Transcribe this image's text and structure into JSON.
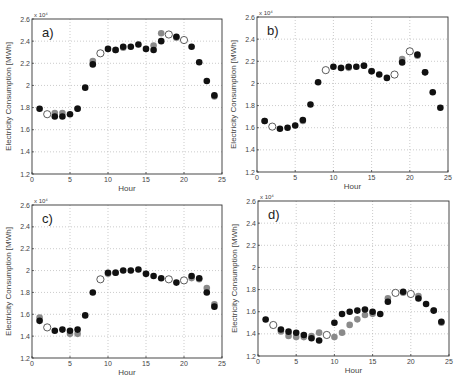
{
  "chart_data": [
    {
      "type": "scatter",
      "panel": "a)",
      "xlabel": "Hour",
      "ylabel": "Electricity Consumption [MWh]",
      "y_multiplier": "x 10^4",
      "xlim": [
        0,
        25
      ],
      "ylim": [
        1.2,
        2.6
      ],
      "xticks": [
        0,
        5,
        10,
        15,
        20,
        25
      ],
      "yticks": [
        1.2,
        1.4,
        1.6,
        1.8,
        2,
        2.2,
        2.4,
        2.6
      ],
      "grid": true,
      "series": [
        {
          "name": "gray",
          "style": "filled-gray",
          "x": [
            3,
            4,
            6,
            8,
            11,
            12,
            16,
            17,
            19,
            24
          ],
          "values": [
            1.74,
            1.74,
            1.78,
            2.21,
            2.31,
            2.33,
            2.35,
            2.46,
            2.42,
            1.89
          ]
        },
        {
          "name": "black",
          "style": "filled-black",
          "x": [
            1,
            3,
            4,
            5,
            6,
            7,
            8,
            10,
            11,
            12,
            13,
            14,
            15,
            16,
            17,
            19,
            21,
            22,
            23,
            24
          ],
          "values": [
            1.79,
            1.72,
            1.72,
            1.74,
            1.79,
            1.98,
            2.19,
            2.33,
            2.32,
            2.35,
            2.35,
            2.37,
            2.33,
            2.32,
            2.4,
            2.44,
            2.35,
            2.21,
            2.04,
            1.91
          ]
        },
        {
          "name": "open",
          "style": "open-circle",
          "x": [
            2,
            9,
            18,
            20
          ],
          "values": [
            1.74,
            2.29,
            2.46,
            2.41
          ]
        }
      ]
    },
    {
      "type": "scatter",
      "panel": "b)",
      "xlabel": "Hour",
      "ylabel": "Electricity Consumption [MWh]",
      "y_multiplier": "x 10^4",
      "xlim": [
        0,
        25
      ],
      "ylim": [
        1.2,
        2.6
      ],
      "xticks": [
        0,
        5,
        10,
        15,
        20,
        25
      ],
      "yticks": [
        1.2,
        1.4,
        1.6,
        1.8,
        2,
        2.2,
        2.4,
        2.6
      ],
      "grid": true,
      "series": [
        {
          "name": "gray",
          "style": "filled-gray",
          "x": [
            1,
            6,
            11,
            12,
            14,
            15,
            19,
            21,
            22
          ],
          "values": [
            1.65,
            1.65,
            2.13,
            2.13,
            2.15,
            2.1,
            2.21,
            2.24,
            2.09
          ]
        },
        {
          "name": "black",
          "style": "filled-black",
          "x": [
            1,
            3,
            4,
            5,
            6,
            7,
            8,
            10,
            11,
            12,
            13,
            14,
            15,
            16,
            17,
            19,
            21,
            22,
            23,
            24
          ],
          "values": [
            1.66,
            1.59,
            1.6,
            1.62,
            1.67,
            1.81,
            2.01,
            2.15,
            2.14,
            2.15,
            2.15,
            2.16,
            2.11,
            2.08,
            2.05,
            2.19,
            2.26,
            2.1,
            1.92,
            1.78
          ]
        },
        {
          "name": "open",
          "style": "open-circle",
          "x": [
            2,
            9,
            18,
            20
          ],
          "values": [
            1.61,
            2.12,
            2.08,
            2.29
          ]
        }
      ]
    },
    {
      "type": "scatter",
      "panel": "c)",
      "xlabel": "Hour",
      "ylabel": "Electricity Consumption [MWh]",
      "y_multiplier": "x 10^4",
      "xlim": [
        0,
        25
      ],
      "ylim": [
        1.2,
        2.6
      ],
      "xticks": [
        0,
        5,
        10,
        15,
        20,
        25
      ],
      "yticks": [
        1.2,
        1.4,
        1.6,
        1.8,
        2,
        2.2,
        2.4,
        2.6
      ],
      "grid": true,
      "series": [
        {
          "name": "gray",
          "style": "filled-gray",
          "x": [
            1,
            5,
            6,
            10,
            11,
            15,
            21,
            22,
            23,
            24
          ],
          "values": [
            1.56,
            1.41,
            1.41,
            1.96,
            1.97,
            1.96,
            1.92,
            1.91,
            1.83,
            1.68
          ]
        },
        {
          "name": "black",
          "style": "filled-black",
          "x": [
            1,
            3,
            4,
            5,
            6,
            7,
            8,
            10,
            11,
            12,
            13,
            14,
            15,
            16,
            17,
            19,
            21,
            22,
            23,
            24
          ],
          "values": [
            1.54,
            1.45,
            1.46,
            1.45,
            1.46,
            1.59,
            1.8,
            1.98,
            1.98,
            2.0,
            2.0,
            2.01,
            1.97,
            1.95,
            1.93,
            1.89,
            1.95,
            1.93,
            1.8,
            1.67
          ]
        },
        {
          "name": "open",
          "style": "open-circle",
          "x": [
            2,
            9,
            18,
            20
          ],
          "values": [
            1.48,
            1.92,
            1.92,
            1.91
          ]
        }
      ]
    },
    {
      "type": "scatter",
      "panel": "d)",
      "xlabel": "Hour",
      "ylabel": "Electricity Consumption [MWh]",
      "y_multiplier": "x 10^4",
      "xlim": [
        0,
        25
      ],
      "ylim": [
        1.2,
        2.6
      ],
      "xticks": [
        0,
        5,
        10,
        15,
        20,
        25
      ],
      "yticks": [
        1.2,
        1.4,
        1.6,
        1.8,
        2,
        2.2,
        2.4,
        2.6
      ],
      "grid": true,
      "series": [
        {
          "name": "gray",
          "style": "filled-gray",
          "x": [
            3,
            4,
            5,
            6,
            7,
            8,
            10,
            11,
            12,
            13,
            14,
            15,
            17,
            19,
            21,
            23,
            24
          ],
          "values": [
            1.41,
            1.37,
            1.36,
            1.36,
            1.37,
            1.4,
            1.36,
            1.4,
            1.47,
            1.52,
            1.56,
            1.57,
            1.71,
            1.76,
            1.73,
            1.6,
            1.49
          ]
        },
        {
          "name": "black",
          "style": "filled-black",
          "x": [
            1,
            3,
            4,
            5,
            6,
            7,
            8,
            10,
            11,
            12,
            13,
            14,
            15,
            16,
            17,
            19,
            21,
            22,
            23,
            24
          ],
          "values": [
            1.53,
            1.44,
            1.42,
            1.41,
            1.39,
            1.36,
            1.34,
            1.5,
            1.58,
            1.6,
            1.61,
            1.62,
            1.6,
            1.58,
            1.69,
            1.78,
            1.72,
            1.67,
            1.61,
            1.51
          ]
        },
        {
          "name": "open",
          "style": "open-circle",
          "x": [
            2,
            9,
            18,
            20
          ],
          "values": [
            1.48,
            1.39,
            1.77,
            1.76
          ]
        }
      ]
    }
  ],
  "panels": [
    {
      "letter": "a)",
      "xlabel": "Hour",
      "ylabel": "Electricity Consumption [MWh]",
      "exp": "x 10⁴"
    },
    {
      "letter": "b)",
      "xlabel": "Hour",
      "ylabel": "Electricity Consumption [MWh]",
      "exp": "x 10⁴"
    },
    {
      "letter": "c)",
      "xlabel": "Hour",
      "ylabel": "Electricity Consumption [MWh]",
      "exp": "x 10⁴"
    },
    {
      "letter": "d)",
      "xlabel": "Hour",
      "ylabel": "Electricity Consumption [MWh]",
      "exp": "x 10⁴"
    }
  ],
  "colors": {
    "black": "#111111",
    "gray": "#8a8a8a",
    "open_stroke": "#333333",
    "grid": "#b5b5b5",
    "axis": "#333333"
  }
}
